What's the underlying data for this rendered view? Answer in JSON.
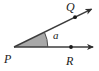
{
  "figure": {
    "name": "angle-diagram",
    "width": 99,
    "height": 71,
    "background_color": "#ffffff"
  },
  "colors": {
    "stroke": "#3c3c3c",
    "label": "#1a1a1a",
    "sector_fill": "#a8a8a8",
    "arc_stroke": "#4a4a4a",
    "dot": "#1a1a1a"
  },
  "labels": {
    "vertex_p": "P",
    "point_q": "Q",
    "point_r": "R",
    "angle": "a"
  },
  "geometry": {
    "vertex_p": {
      "x": 14,
      "y": 47
    },
    "point_q": {
      "x": 75,
      "y": 17
    },
    "point_r": {
      "x": 71,
      "y": 47
    },
    "ray_pq_tip": {
      "x": 96,
      "y": 7
    },
    "ray_pr_tip": {
      "x": 97,
      "y": 47
    },
    "arc_radius": 34,
    "angle_degrees": 26
  },
  "label_positions": {
    "vertex_p": {
      "x": 4,
      "y": 63
    },
    "point_q": {
      "x": 66,
      "y": 11
    },
    "point_r": {
      "x": 66,
      "y": 65
    },
    "angle": {
      "x": 53,
      "y": 39
    }
  }
}
